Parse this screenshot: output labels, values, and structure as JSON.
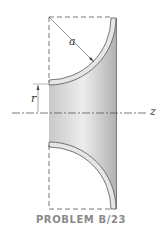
{
  "figure": {
    "caption": "PROBLEM B/23",
    "labels": {
      "radius_a": "a",
      "radius_r": "r",
      "axis": "z"
    },
    "colors": {
      "shade_dark": "#a9a9a9",
      "shade_light": "#f2f2f2",
      "line": "#555555",
      "caption": "#8a8a8a"
    }
  }
}
